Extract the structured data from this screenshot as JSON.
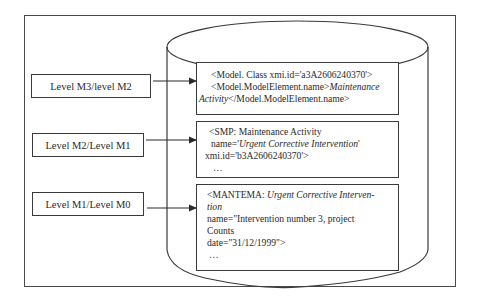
{
  "diagram": {
    "type": "metamodel-level-mapping",
    "levels": [
      {
        "label": "Level M3/level M2"
      },
      {
        "label": "Level M2/Level M1"
      },
      {
        "label": "Level M1/Level M0"
      }
    ],
    "repository_shape": "cylinder",
    "contents": [
      {
        "lines": [
          {
            "text": "<Model. Class xmi.id='a3A2606240370'>"
          },
          {
            "prefix": "<Model.ModelElement.name>",
            "italic": "Maintenance"
          },
          {
            "italic": "Activity",
            "suffix": "</Model.ModelElement.name>"
          }
        ]
      },
      {
        "lines": [
          {
            "text": "<SMP: Maintenance Activity"
          },
          {
            "prefix": "name='",
            "italic": "Urgent Corrective Intervention",
            "suffix": "'"
          },
          {
            "text": "xmi.id='b3A2606240370'>"
          },
          {
            "text": "…"
          }
        ]
      },
      {
        "lines": [
          {
            "prefix": "<MANTEMA: ",
            "italic": "Urgent Corrective Interven-"
          },
          {
            "italic": "tion"
          },
          {
            "text": "name=\"Intervention number 3, project"
          },
          {
            "text": "Counts"
          },
          {
            "text": "date=\"31/12/1999\">"
          },
          {
            "text": "…"
          }
        ]
      }
    ],
    "colors": {
      "stroke": "#3a3a3a",
      "background": "#ffffff",
      "text": "#2a2a2a"
    }
  }
}
